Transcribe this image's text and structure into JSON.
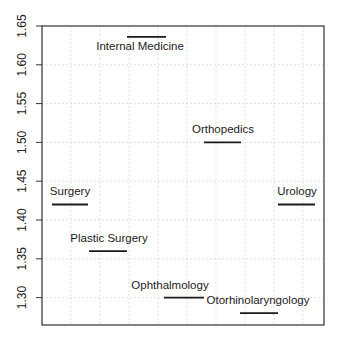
{
  "chart_data": {
    "type": "segment",
    "title": "",
    "xlabel": "",
    "ylabel": "",
    "ylim": [
      1.265,
      1.65
    ],
    "yticks": [
      1.3,
      1.35,
      1.4,
      1.45,
      1.5,
      1.55,
      1.6,
      1.65
    ],
    "ytick_labels": [
      "1.30",
      "1.35",
      "1.40",
      "1.45",
      "1.50",
      "1.55",
      "1.60",
      "1.65"
    ],
    "grid": true,
    "legend": null,
    "categories": [
      "Surgery",
      "Plastic Surgery",
      "Internal Medicine",
      "Ophthalmology",
      "Orthopedics",
      "Otorhinolaryngology",
      "Urology"
    ],
    "values": [
      1.42,
      1.36,
      1.636,
      1.3,
      1.5,
      1.28,
      1.42
    ],
    "segments": [
      {
        "label": "Surgery",
        "value": 1.42,
        "x0": 52,
        "x1": 88,
        "label_x": 70,
        "label_dy": -9
      },
      {
        "label": "Plastic Surgery",
        "value": 1.36,
        "x0": 89,
        "x1": 127,
        "label_x": 109,
        "label_dy": -9
      },
      {
        "label": "Internal Medicine",
        "value": 1.636,
        "x0": 127,
        "x1": 166,
        "label_x": 140,
        "label_dy": 13
      },
      {
        "label": "Ophthalmology",
        "value": 1.3,
        "x0": 164,
        "x1": 204,
        "label_x": 170,
        "label_dy": -9
      },
      {
        "label": "Orthopedics",
        "value": 1.5,
        "x0": 204,
        "x1": 241,
        "label_x": 223,
        "label_dy": -9
      },
      {
        "label": "Otorhinolaryngology",
        "value": 1.28,
        "x0": 240,
        "x1": 278,
        "label_x": 258,
        "label_dy": -9
      },
      {
        "label": "Urology",
        "value": 1.42,
        "x0": 278,
        "x1": 315,
        "label_x": 297,
        "label_dy": -9
      }
    ]
  },
  "colors": {
    "axis": "#333333",
    "grid": "#cccccc",
    "segment": "#1a1a1a",
    "text": "#222222",
    "background": "#ffffff"
  }
}
